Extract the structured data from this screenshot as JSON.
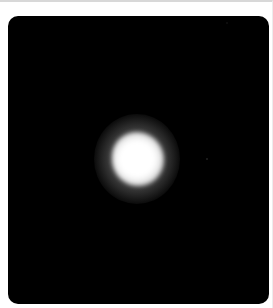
{
  "image": {
    "description": "Grayscale microscopy-style image: black background with a single diffuse bright white spot near center",
    "background_color": "#000000",
    "spot_color": "#ffffff",
    "frame_border_color": "#d8d8d8"
  }
}
